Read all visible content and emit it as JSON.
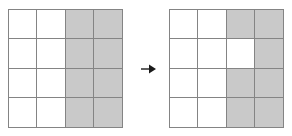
{
  "figure": {
    "kind": "grid-transformation-diagram",
    "background_color": "#ffffff",
    "grid_line_color": "#848484",
    "shaded_color": "#c9c9c9",
    "unshaded_color": "#ffffff",
    "rows": 4,
    "columns": 4,
    "left_grid": {
      "label": "before",
      "shaded_count": 8,
      "cells": [
        [
          0,
          0,
          1,
          1
        ],
        [
          0,
          0,
          1,
          1
        ],
        [
          0,
          0,
          1,
          1
        ],
        [
          0,
          0,
          1,
          1
        ]
      ]
    },
    "right_grid": {
      "label": "after",
      "shaded_count": 7,
      "cells": [
        [
          0,
          0,
          1,
          1
        ],
        [
          0,
          0,
          0,
          1
        ],
        [
          0,
          0,
          1,
          1
        ],
        [
          0,
          0,
          1,
          1
        ]
      ]
    },
    "arrow": {
      "icon": "arrow-right-icon",
      "direction": "right",
      "color": "#1a1a1a"
    }
  }
}
